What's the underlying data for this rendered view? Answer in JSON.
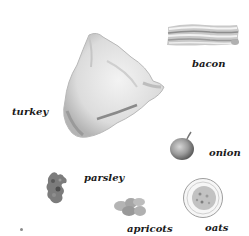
{
  "ingredients": [
    {
      "id": "bacon",
      "label": "bacon",
      "icon": "bacon-strips-icon"
    },
    {
      "id": "turkey",
      "label": "turkey",
      "icon": "whole-turkey-icon"
    },
    {
      "id": "onion",
      "label": "onion",
      "icon": "onion-icon"
    },
    {
      "id": "parsley",
      "label": "parsley",
      "icon": "parsley-sprig-icon"
    },
    {
      "id": "apricots",
      "label": "apricots",
      "icon": "dried-apricots-icon"
    },
    {
      "id": "oats",
      "label": "oats",
      "icon": "oats-bowl-icon"
    }
  ],
  "colors": {
    "background": "#ffffff",
    "label_text": "#1a1a1a",
    "illustration_gray_dark": "#6e6e6e",
    "illustration_gray_mid": "#a8a8a8",
    "illustration_gray_light": "#e2e2e2"
  }
}
